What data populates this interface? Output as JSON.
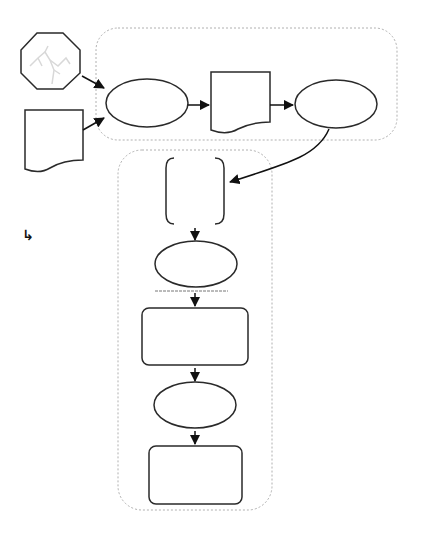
{
  "diagram": {
    "type": "flowchart",
    "colors": {
      "stroke": "#2a2a2a",
      "container_border": "#b0b0b0",
      "background": "#ffffff",
      "octagon_texture": "#d8d8d8"
    },
    "containers": [
      {
        "id": "top-group",
        "style": "dotted-rounded"
      },
      {
        "id": "bottom-group",
        "style": "dotted-rounded"
      }
    ],
    "nodes": [
      {
        "id": "octagon-input",
        "shape": "octagon",
        "label": ""
      },
      {
        "id": "document-input",
        "shape": "document",
        "label": ""
      },
      {
        "id": "process-ellipse-1",
        "shape": "ellipse",
        "label": ""
      },
      {
        "id": "document-mid",
        "shape": "document",
        "label": ""
      },
      {
        "id": "process-ellipse-2",
        "shape": "ellipse",
        "label": ""
      },
      {
        "id": "bracket-box",
        "shape": "bracket",
        "label": ""
      },
      {
        "id": "process-ellipse-3",
        "shape": "ellipse",
        "label": ""
      },
      {
        "id": "rounded-rect-1",
        "shape": "rounded-rect",
        "label": ""
      },
      {
        "id": "process-ellipse-4",
        "shape": "ellipse",
        "label": ""
      },
      {
        "id": "rounded-rect-2",
        "shape": "rounded-rect",
        "label": ""
      }
    ],
    "edges": [
      {
        "from": "octagon-input",
        "to": "process-ellipse-1"
      },
      {
        "from": "document-input",
        "to": "process-ellipse-1"
      },
      {
        "from": "process-ellipse-1",
        "to": "document-mid"
      },
      {
        "from": "document-mid",
        "to": "process-ellipse-2"
      },
      {
        "from": "process-ellipse-2",
        "to": "bracket-box",
        "style": "curved"
      },
      {
        "from": "bracket-box",
        "to": "process-ellipse-3"
      },
      {
        "from": "process-ellipse-3",
        "to": "rounded-rect-1"
      },
      {
        "from": "rounded-rect-1",
        "to": "process-ellipse-4"
      },
      {
        "from": "process-ellipse-4",
        "to": "rounded-rect-2"
      }
    ],
    "stray_glyph": "↳"
  }
}
